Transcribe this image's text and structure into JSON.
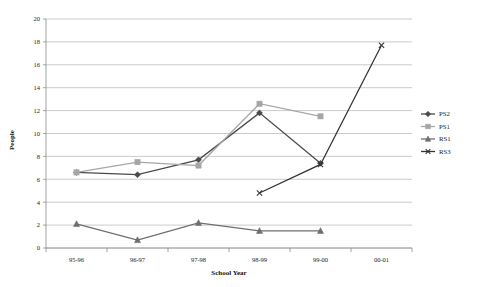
{
  "chart_data": {
    "type": "line",
    "title": "",
    "xlabel": "School Year",
    "ylabel": "People",
    "categories": [
      "95-96",
      "96-97",
      "97-98",
      "98-99",
      "99-00",
      "00-01"
    ],
    "ylim": [
      0,
      20
    ],
    "ytick_step": 2,
    "yticks": [
      "0",
      "2",
      "4",
      "6",
      "8",
      "10",
      "12",
      "14",
      "16",
      "18",
      "20"
    ],
    "grid": "horizontal",
    "legend_position": "right",
    "series": [
      {
        "name": "PS2",
        "color": "#4a4a4a",
        "marker": "diamond",
        "values": [
          6.6,
          6.4,
          7.7,
          11.8,
          7.4,
          null
        ]
      },
      {
        "name": "PS1",
        "color": "#a6a6a6",
        "marker": "square",
        "values": [
          6.6,
          7.5,
          7.2,
          12.6,
          11.5,
          null
        ]
      },
      {
        "name": "RS1",
        "color": "#6e6e6e",
        "marker": "triangle",
        "values": [
          2.1,
          0.7,
          2.2,
          1.5,
          1.5,
          null
        ]
      },
      {
        "name": "RS3",
        "color": "#333333",
        "marker": "x",
        "values": [
          null,
          null,
          null,
          4.8,
          7.3,
          17.7
        ]
      }
    ]
  },
  "legend": {
    "entries": [
      {
        "label": "PS2"
      },
      {
        "label": "PS1"
      },
      {
        "label": "RS1"
      },
      {
        "label": "RS3"
      }
    ]
  }
}
